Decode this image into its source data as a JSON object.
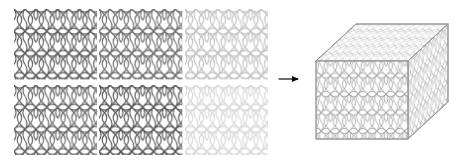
{
  "figure": {
    "background_color": "#ffffff",
    "width": 459,
    "height": 163
  },
  "motif": {
    "name": "interlocking-curved-lattice",
    "description": "Repeating interlocking hourglass and oval lattice motif drawn as thin curved strokes",
    "stroke_color": "#4a4a4a",
    "tile_width": 22,
    "tile_height": 22,
    "stroke_width": 1.1
  },
  "panel_grid": {
    "name": "pattern-panel-grid",
    "rows": 2,
    "columns": 3,
    "left": 14,
    "top": 9,
    "width": 254,
    "height": 146,
    "column_gap": 2,
    "row_gap": 5,
    "panels": [
      {
        "id": "panel-r1c1",
        "row": 1,
        "column": 1,
        "opacity": 0.92,
        "stroke_color": "#3f3f3f"
      },
      {
        "id": "panel-r1c2",
        "row": 1,
        "column": 2,
        "opacity": 0.82,
        "stroke_color": "#4a4a4a"
      },
      {
        "id": "panel-r1c3",
        "row": 1,
        "column": 3,
        "opacity": 0.34,
        "stroke_color": "#8d8d8d"
      },
      {
        "id": "panel-r2c1",
        "row": 2,
        "column": 1,
        "opacity": 0.88,
        "stroke_color": "#424242"
      },
      {
        "id": "panel-r2c2",
        "row": 2,
        "column": 2,
        "opacity": 0.95,
        "stroke_color": "#3a3a3a"
      },
      {
        "id": "panel-r2c3",
        "row": 2,
        "column": 3,
        "opacity": 0.22,
        "stroke_color": "#a5a5a5"
      }
    ]
  },
  "arrow": {
    "name": "transform-arrow",
    "direction": "right",
    "color": "#0a0a0a",
    "left": 278,
    "top": 73,
    "width": 28,
    "height": 12,
    "label": ""
  },
  "cube": {
    "name": "patterned-cube",
    "left": 312,
    "top": 14,
    "width": 140,
    "height": 136,
    "edge_color": "#9a9a9a",
    "edge_width": 1,
    "faces": [
      {
        "id": "cube-face-front",
        "label": "front",
        "opacity": 0.72,
        "stroke_color": "#777777"
      },
      {
        "id": "cube-face-top",
        "label": "top",
        "opacity": 0.55,
        "stroke_color": "#8a8a8a"
      },
      {
        "id": "cube-face-right",
        "label": "right",
        "opacity": 0.6,
        "stroke_color": "#838383"
      }
    ],
    "geometry": {
      "front_top_left": [
        4,
        41
      ],
      "front_top_right": [
        96,
        41
      ],
      "front_bottom_left": [
        4,
        119
      ],
      "front_bottom_right": [
        96,
        119
      ],
      "back_top_left": [
        44,
        4
      ],
      "back_top_right": [
        136,
        4
      ],
      "back_bottom_right": [
        136,
        82
      ]
    }
  }
}
